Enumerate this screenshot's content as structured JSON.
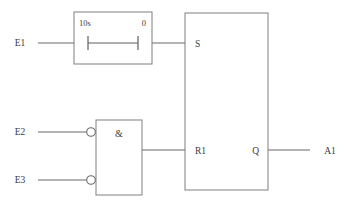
{
  "diagram": {
    "colors": {
      "background": "#ffffff",
      "wire": "#6b6b6b",
      "box_border": "#8a8a8a",
      "text": "#3c3c3c"
    },
    "inputs": [
      {
        "id": "E1",
        "label": "E1",
        "target": "timer-block"
      },
      {
        "id": "E2",
        "label": "E2",
        "target": "and-gate",
        "negated": true
      },
      {
        "id": "E3",
        "label": "E3",
        "target": "and-gate",
        "negated": true
      }
    ],
    "outputs": [
      {
        "id": "A1",
        "label": "A1",
        "source": "Q"
      }
    ],
    "blocks": [
      {
        "id": "timer-block",
        "type": "timer",
        "left_label": "10s",
        "right_label": "0",
        "symbol": "delay-bar"
      },
      {
        "id": "and-gate",
        "type": "and",
        "symbol": "&",
        "inputs": [
          "E2",
          "E3"
        ],
        "inverted_inputs": true
      },
      {
        "id": "flipflop-block",
        "type": "sr-flipflop",
        "ports": [
          {
            "name": "S",
            "label": "S",
            "side": "left"
          },
          {
            "name": "R1",
            "label": "R1",
            "side": "left"
          },
          {
            "name": "Q",
            "label": "Q",
            "side": "right"
          }
        ]
      }
    ]
  }
}
